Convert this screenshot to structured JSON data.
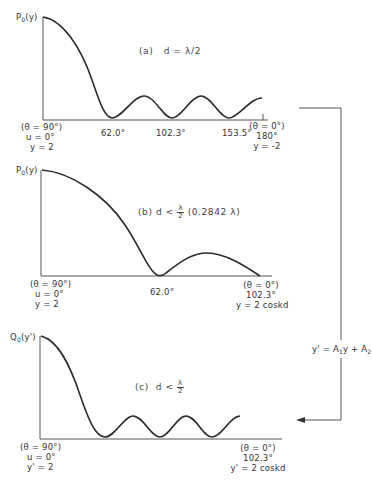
{
  "figure": {
    "panels": [
      {
        "id": "a",
        "y_axis_label": "P",
        "y_axis_sub": "0",
        "y_axis_arg": "(y)",
        "title_prefix": "(a)",
        "title_condition": "d = λ/2",
        "left_end": [
          "(θ = 90°)",
          "u = 0°",
          "y = 2"
        ],
        "tick_labels": [
          "62.0°",
          "102.3°",
          "153.5°"
        ],
        "right_end": [
          "(θ = 0°)",
          "180°",
          "y = -2"
        ]
      },
      {
        "id": "b",
        "y_axis_label": "P",
        "y_axis_sub": "0",
        "y_axis_arg": "(y)",
        "title_prefix": "(b)",
        "title_condition": "d <",
        "title_frac_num": "λ",
        "title_frac_den": "2",
        "title_suffix": "(0.2842 λ)",
        "left_end": [
          "(θ = 90°)",
          "u = 0°",
          "y = 2"
        ],
        "tick_labels": [
          "62.0°"
        ],
        "right_end": [
          "(θ = 0°)",
          "102.3°",
          "y = 2 coskd"
        ]
      },
      {
        "id": "c",
        "y_axis_label": "Q",
        "y_axis_sub": "0",
        "y_axis_arg": "(y')",
        "title_prefix": "(c)",
        "title_condition": "d <",
        "title_frac_num": "λ",
        "title_frac_den": "2",
        "left_end": [
          "(θ = 90°)",
          "u = 0°",
          "y' = 2"
        ],
        "tick_labels": [],
        "right_end": [
          "(θ = 0°)",
          "102.3°",
          "y' = 2 coskd"
        ]
      }
    ],
    "transform": {
      "label_lhs": "y' = A",
      "label_sub1": "1",
      "label_mid": "y + A",
      "label_sub2": "2",
      "arrow_icon": "arrow-left-icon"
    },
    "colors": {
      "curve": "#2b2b2b",
      "axis": "#444444",
      "background": "#ffffff"
    }
  }
}
